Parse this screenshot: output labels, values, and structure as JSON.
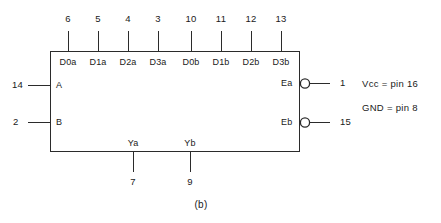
{
  "figure": {
    "caption": "(b)",
    "device_body": {
      "shape": "rectangle",
      "x": 50,
      "y": 51,
      "width": 250,
      "height": 101
    },
    "colors": {
      "background": "#ffffff",
      "line": "#2b2b2b",
      "text": "#1a1a1a"
    }
  },
  "top_pins": [
    {
      "pin": "6",
      "label": "D0a",
      "x": 68
    },
    {
      "pin": "5",
      "label": "D1a",
      "x": 98
    },
    {
      "pin": "4",
      "label": "D2a",
      "x": 128
    },
    {
      "pin": "3",
      "label": "D3a",
      "x": 158
    },
    {
      "pin": "10",
      "label": "D0b",
      "x": 191
    },
    {
      "pin": "11",
      "label": "D1b",
      "x": 221
    },
    {
      "pin": "12",
      "label": "D2b",
      "x": 251
    },
    {
      "pin": "13",
      "label": "D3b",
      "x": 281
    }
  ],
  "left_pins": [
    {
      "pin": "14",
      "label": "A",
      "y": 86
    },
    {
      "pin": "2",
      "label": "B",
      "y": 123
    }
  ],
  "right_pins": [
    {
      "pin": "1",
      "label": "Ea",
      "y": 84,
      "inverted": true
    },
    {
      "pin": "15",
      "label": "Eb",
      "y": 123,
      "inverted": true
    }
  ],
  "bottom_pins": [
    {
      "pin": "7",
      "label": "Ya",
      "x": 133
    },
    {
      "pin": "9",
      "label": "Yb",
      "x": 190
    }
  ],
  "notes": [
    {
      "text": "Vcc = pin 16",
      "x": 362,
      "y": 84
    },
    {
      "text": "GND = pin 8",
      "x": 362,
      "y": 108
    }
  ]
}
